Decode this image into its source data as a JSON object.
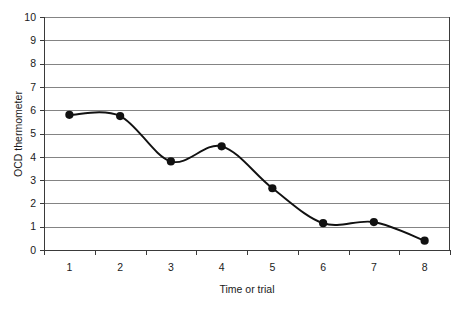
{
  "chart_data": {
    "type": "line",
    "title": "",
    "xlabel": "Time or trial",
    "ylabel": "OCD thermometer",
    "categories": [
      "1",
      "2",
      "3",
      "4",
      "5",
      "6",
      "7",
      "8"
    ],
    "x": [
      1,
      2,
      3,
      4,
      5,
      6,
      7,
      8
    ],
    "values": [
      5.8,
      5.75,
      3.8,
      4.45,
      2.65,
      1.15,
      1.2,
      0.4
    ],
    "series": [
      {
        "name": "OCD thermometer",
        "values": [
          5.8,
          5.75,
          3.8,
          4.45,
          2.65,
          1.15,
          1.2,
          0.4
        ]
      }
    ],
    "ylim": [
      0,
      10
    ],
    "yticks": [
      0,
      1,
      2,
      3,
      4,
      5,
      6,
      7,
      8,
      9,
      10
    ],
    "ytick_labels": [
      "0",
      "1",
      "2",
      "3",
      "4",
      "5",
      "6",
      "7",
      "8",
      "9",
      "10"
    ],
    "xtick_labels": [
      "1",
      "2",
      "3",
      "4",
      "5",
      "6",
      "7",
      "8"
    ],
    "grid": true,
    "grid_axis": "y",
    "legend": false,
    "legend_position": "none",
    "smoothing": true,
    "marker": "filled-circle",
    "colors": {
      "line": "#111111",
      "marker": "#111111",
      "grid": "#848484",
      "axis": "#3a3a3a",
      "text": "#1a1a1a",
      "background": "#ffffff"
    }
  }
}
